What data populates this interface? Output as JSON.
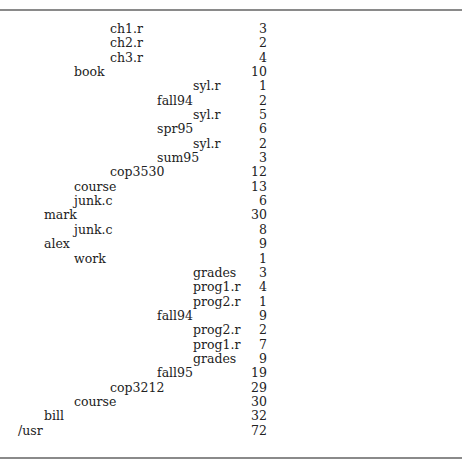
{
  "figure": {
    "indent_px": [
      18,
      44,
      74,
      110,
      157,
      193
    ],
    "rows": [
      {
        "name": "ch1.r",
        "level": 3,
        "size": "3"
      },
      {
        "name": "ch2.r",
        "level": 3,
        "size": "2"
      },
      {
        "name": "ch3.r",
        "level": 3,
        "size": "4"
      },
      {
        "name": "book",
        "level": 2,
        "size": "10"
      },
      {
        "name": "syl.r",
        "level": 5,
        "size": "1"
      },
      {
        "name": "fall94",
        "level": 4,
        "size": "2"
      },
      {
        "name": "syl.r",
        "level": 5,
        "size": "5"
      },
      {
        "name": "spr95",
        "level": 4,
        "size": "6"
      },
      {
        "name": "syl.r",
        "level": 5,
        "size": "2"
      },
      {
        "name": "sum95",
        "level": 4,
        "size": "3"
      },
      {
        "name": "cop3530",
        "level": 3,
        "size": "12"
      },
      {
        "name": "course",
        "level": 2,
        "size": "13"
      },
      {
        "name": "junk.c",
        "level": 2,
        "size": "6"
      },
      {
        "name": "mark",
        "level": 1,
        "size": "30"
      },
      {
        "name": "junk.c",
        "level": 2,
        "size": "8"
      },
      {
        "name": "alex",
        "level": 1,
        "size": "9"
      },
      {
        "name": "work",
        "level": 2,
        "size": "1"
      },
      {
        "name": "grades",
        "level": 5,
        "size": "3"
      },
      {
        "name": "prog1.r",
        "level": 5,
        "size": "4"
      },
      {
        "name": "prog2.r",
        "level": 5,
        "size": "1"
      },
      {
        "name": "fall94",
        "level": 4,
        "size": "9"
      },
      {
        "name": "prog2.r",
        "level": 5,
        "size": "2"
      },
      {
        "name": "prog1.r",
        "level": 5,
        "size": "7"
      },
      {
        "name": "grades",
        "level": 5,
        "size": "9"
      },
      {
        "name": "fall95",
        "level": 4,
        "size": "19"
      },
      {
        "name": "cop3212",
        "level": 3,
        "size": "29"
      },
      {
        "name": "course",
        "level": 2,
        "size": "30"
      },
      {
        "name": "bill",
        "level": 1,
        "size": "32"
      },
      {
        "name": "/usr",
        "level": 0,
        "size": "72"
      }
    ]
  }
}
